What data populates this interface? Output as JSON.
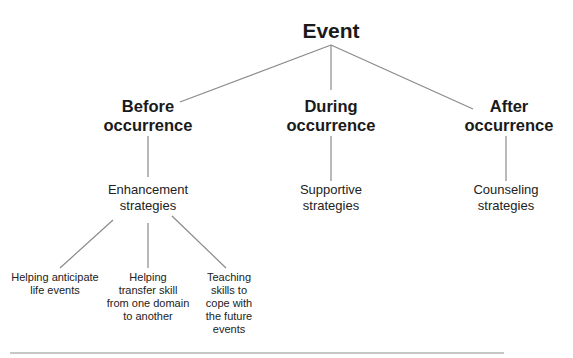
{
  "diagram": {
    "type": "tree",
    "root": {
      "id": "event",
      "label": "Event"
    },
    "phases": [
      {
        "id": "before",
        "label_lines": [
          "Before",
          "occurrence"
        ],
        "strategy": {
          "label_lines": [
            "Enhancement",
            "strategies"
          ],
          "children": [
            {
              "label_lines": [
                "Helping anticipate",
                "life events"
              ]
            },
            {
              "label_lines": [
                "Helping",
                "transfer skill",
                "from one domain",
                "to another"
              ]
            },
            {
              "label_lines": [
                "Teaching",
                "skills to",
                "cope with",
                "the future",
                "events"
              ]
            }
          ]
        }
      },
      {
        "id": "during",
        "label_lines": [
          "During",
          "occurrence"
        ],
        "strategy": {
          "label_lines": [
            "Supportive",
            "strategies"
          ],
          "children": []
        }
      },
      {
        "id": "after",
        "label_lines": [
          "After",
          "occurrence"
        ],
        "strategy": {
          "label_lines": [
            "Counseling",
            "strategies"
          ],
          "children": []
        }
      }
    ],
    "colors": {
      "line": "#8a8a8a",
      "text": "#1a1a1a",
      "rule": "#b5b5b5"
    }
  }
}
